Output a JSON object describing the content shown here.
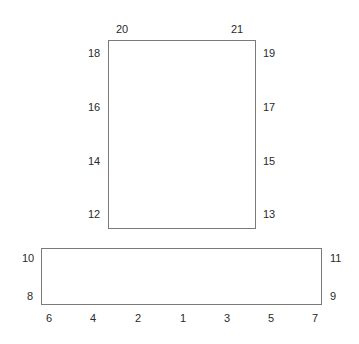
{
  "diagram": {
    "top_rect": {
      "labels": {
        "top_left": "20",
        "top_right": "21",
        "left": [
          "18",
          "16",
          "14",
          "12"
        ],
        "right": [
          "19",
          "17",
          "15",
          "13"
        ]
      }
    },
    "bottom_rect": {
      "labels": {
        "left": [
          "10",
          "8"
        ],
        "right": [
          "11",
          "9"
        ],
        "bottom": [
          "6",
          "4",
          "2",
          "1",
          "3",
          "5",
          "7"
        ]
      }
    },
    "line_color": "#7a7a7a"
  }
}
